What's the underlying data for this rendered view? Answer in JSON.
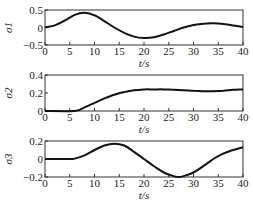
{
  "chart_data": [
    {
      "type": "line",
      "ylabel": "σ1",
      "xlabel": "t/s",
      "xlim": [
        0,
        40
      ],
      "ylim": [
        -0.5,
        0.5
      ],
      "xticks": [
        "0",
        "5",
        "10",
        "15",
        "20",
        "25",
        "30",
        "35",
        "40"
      ],
      "yticks": [
        "-0.5",
        "0",
        "0.5"
      ],
      "grid": false,
      "series": [
        {
          "name": "σ1",
          "x": [
            0,
            2,
            4,
            6,
            8,
            10,
            12,
            14,
            16,
            18,
            20,
            22,
            24,
            26,
            28,
            30,
            32,
            34,
            36,
            38,
            40
          ],
          "values": [
            0,
            0.06,
            0.2,
            0.36,
            0.42,
            0.35,
            0.18,
            0.0,
            -0.15,
            -0.26,
            -0.3,
            -0.28,
            -0.2,
            -0.1,
            0.0,
            0.07,
            0.11,
            0.12,
            0.1,
            0.06,
            0.01
          ]
        }
      ]
    },
    {
      "type": "line",
      "ylabel": "σ2",
      "xlabel": "t/s",
      "xlim": [
        0,
        40
      ],
      "ylim": [
        0,
        0.4
      ],
      "xticks": [
        "0",
        "5",
        "10",
        "15",
        "20",
        "25",
        "30",
        "35",
        "40"
      ],
      "yticks": [
        "0",
        "0.2",
        "0.4"
      ],
      "grid": false,
      "series": [
        {
          "name": "σ2",
          "x": [
            0,
            6,
            8,
            10,
            12,
            14,
            16,
            18,
            20,
            22,
            24,
            26,
            28,
            30,
            32,
            34,
            36,
            38,
            40
          ],
          "values": [
            0,
            0,
            0.04,
            0.09,
            0.14,
            0.18,
            0.21,
            0.23,
            0.24,
            0.24,
            0.24,
            0.235,
            0.23,
            0.225,
            0.22,
            0.22,
            0.225,
            0.235,
            0.24
          ]
        }
      ]
    },
    {
      "type": "line",
      "ylabel": "σ3",
      "xlabel": "t/s",
      "xlim": [
        0,
        40
      ],
      "ylim": [
        -0.2,
        0.2
      ],
      "xticks": [
        "0",
        "5",
        "10",
        "15",
        "20",
        "25",
        "30",
        "35",
        "40"
      ],
      "yticks": [
        "-0.2",
        "0",
        "0.2"
      ],
      "grid": false,
      "series": [
        {
          "name": "σ3",
          "x": [
            0,
            5,
            6,
            8,
            10,
            12,
            14,
            16,
            18,
            20,
            22,
            24,
            26,
            27,
            28,
            30,
            32,
            34,
            36,
            38,
            40
          ],
          "values": [
            0,
            0,
            0.005,
            0.04,
            0.1,
            0.15,
            0.17,
            0.15,
            0.08,
            0.0,
            -0.08,
            -0.15,
            -0.19,
            -0.2,
            -0.19,
            -0.15,
            -0.08,
            0.0,
            0.06,
            0.1,
            0.13
          ]
        }
      ]
    }
  ],
  "panels": [
    {
      "ylabel": "σ1",
      "xlabel": "t/s"
    },
    {
      "ylabel": "σ2",
      "xlabel": "t/s"
    },
    {
      "ylabel": "σ3",
      "xlabel": "t/s"
    }
  ]
}
